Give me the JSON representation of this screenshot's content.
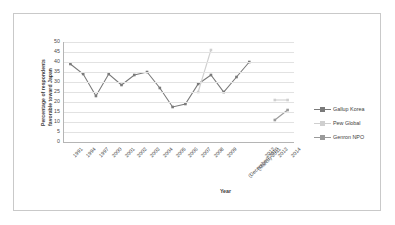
{
  "chart_data": {
    "type": "line",
    "title": "",
    "xlabel": "Year",
    "ylabel": "Percentage of respondents favorable toward Japan",
    "ylabel_line1": "Percentage of respondents",
    "ylabel_line2": "favorable toward Japan",
    "ylim": [
      0,
      50
    ],
    "ytick_step": 5,
    "yticks": [
      "50",
      "45",
      "40",
      "35",
      "30",
      "25",
      "20",
      "15",
      "10",
      "5",
      "0"
    ],
    "grid": true,
    "legend_position": "right",
    "categories": [
      "1991",
      "1994",
      "1997",
      "2000",
      "2001",
      "2002",
      "2003",
      "2004",
      "2005",
      "2006",
      "2007",
      "2008",
      "2009",
      "(December) 2010",
      "(March) 2011",
      "2012",
      "2013",
      "2014"
    ],
    "series": [
      {
        "name": "Gallup Korea",
        "color": "#7a7a7a",
        "values": [
          39,
          34,
          23,
          34,
          28.5,
          33.5,
          35,
          27,
          17.5,
          19,
          29,
          33.5,
          25,
          32.5,
          40,
          null,
          null,
          null
        ]
      },
      {
        "name": "Pew Global",
        "color": "#cfcfcf",
        "values": [
          null,
          null,
          null,
          null,
          null,
          null,
          null,
          null,
          null,
          null,
          25,
          46,
          null,
          null,
          null,
          null,
          21,
          21
        ]
      },
      {
        "name": "Genron NPO",
        "color": "#9a9a9a",
        "values": [
          null,
          null,
          null,
          null,
          null,
          null,
          null,
          null,
          null,
          null,
          null,
          null,
          null,
          null,
          null,
          null,
          11,
          16
        ]
      }
    ]
  },
  "legend": {
    "entries": [
      {
        "label": "Gallup Korea",
        "color": "#7a7a7a"
      },
      {
        "label": "Pew Global",
        "color": "#cfcfcf"
      },
      {
        "label": "Genron NPO",
        "color": "#9a9a9a"
      }
    ]
  },
  "colors": {
    "background": "#ffffff",
    "frame_border": "#c9c9c9",
    "gridline": "#e2e2e2",
    "axis": "#b5b5b5",
    "text": "#4a4a4a"
  }
}
